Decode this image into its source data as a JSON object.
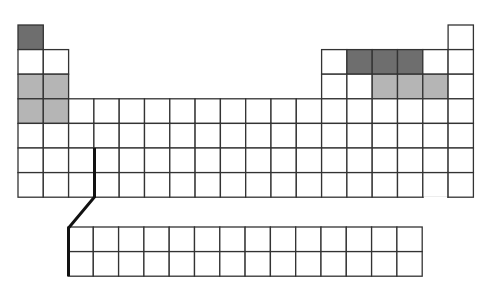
{
  "diagram": {
    "title": "",
    "colors": {
      "background": "#ffffff",
      "grid_line": "#333333",
      "empty": "#ffffff",
      "light_shade": "#b5b5b5",
      "dark_shade": "#6e6e6e",
      "divider_line": "#111111"
    },
    "grid": {
      "origin_x": 18,
      "origin_y": 25,
      "cell_w": 25.3,
      "cell_h": 24.6,
      "columns": 18,
      "rows": 7
    },
    "main_cells": [
      {
        "row": 1,
        "col": 1,
        "shade": "dark"
      },
      {
        "row": 1,
        "col": 18,
        "shade": "none"
      },
      {
        "row": 2,
        "col": 1,
        "shade": "none"
      },
      {
        "row": 2,
        "col": 2,
        "shade": "none"
      },
      {
        "row": 2,
        "col": 13,
        "shade": "none"
      },
      {
        "row": 2,
        "col": 14,
        "shade": "dark"
      },
      {
        "row": 2,
        "col": 15,
        "shade": "dark"
      },
      {
        "row": 2,
        "col": 16,
        "shade": "dark"
      },
      {
        "row": 2,
        "col": 17,
        "shade": "none"
      },
      {
        "row": 2,
        "col": 18,
        "shade": "none"
      },
      {
        "row": 3,
        "col": 1,
        "shade": "light"
      },
      {
        "row": 3,
        "col": 2,
        "shade": "light"
      },
      {
        "row": 3,
        "col": 13,
        "shade": "none"
      },
      {
        "row": 3,
        "col": 14,
        "shade": "none"
      },
      {
        "row": 3,
        "col": 15,
        "shade": "light"
      },
      {
        "row": 3,
        "col": 16,
        "shade": "light"
      },
      {
        "row": 3,
        "col": 17,
        "shade": "light"
      },
      {
        "row": 3,
        "col": 18,
        "shade": "none"
      },
      {
        "row": 4,
        "col": 1,
        "shade": "light"
      },
      {
        "row": 4,
        "col": 2,
        "shade": "light"
      }
    ],
    "full_rows": [
      4,
      5,
      6,
      7
    ],
    "missing_bottom_edge": {
      "row": 7,
      "col": 17
    },
    "lanthanide_actinide_block": {
      "x": 68,
      "y": 227,
      "columns": 14,
      "rows": 2,
      "cell_w": 25.3,
      "cell_h": 24.6
    },
    "divider": {
      "points": [
        [
          94.5,
          148
        ],
        [
          94.5,
          197
        ],
        [
          68.5,
          228
        ],
        [
          68.5,
          276
        ]
      ],
      "width": 3
    }
  }
}
